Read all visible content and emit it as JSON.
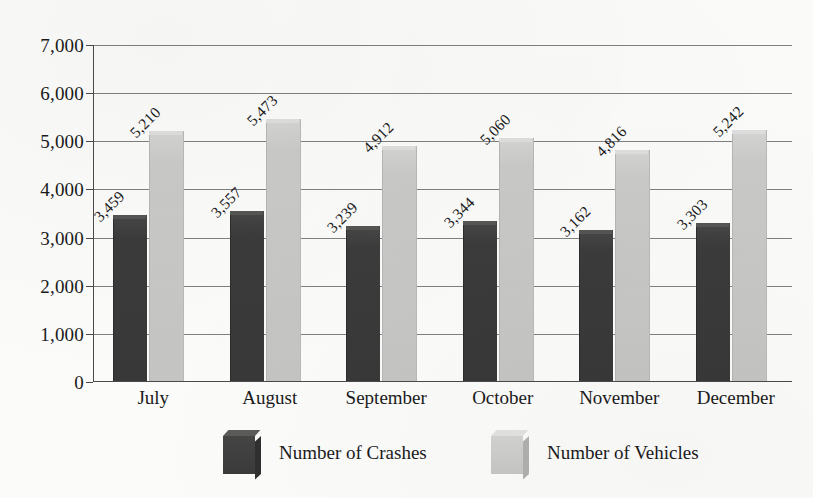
{
  "chart_data": {
    "type": "bar",
    "title": "",
    "subtitle": "",
    "xlabel": "",
    "ylabel": "",
    "ylim": [
      0,
      7000
    ],
    "ytick_labels": [
      "7,000",
      "6,000",
      "5,000",
      "4,000",
      "3,000",
      "2,000",
      "1,000",
      "0"
    ],
    "ytick_values": [
      7000,
      6000,
      5000,
      4000,
      3000,
      2000,
      1000,
      0
    ],
    "grid": true,
    "legend_position": "bottom",
    "categories": [
      "July",
      "August",
      "September",
      "October",
      "November",
      "December"
    ],
    "series": [
      {
        "name": "Number of Crashes",
        "color": "#3b3b3b",
        "values": [
          3459,
          3557,
          3239,
          3344,
          3162,
          3303
        ],
        "labels": [
          "3,459",
          "3,557",
          "3,239",
          "3,344",
          "3,162",
          "3,303"
        ]
      },
      {
        "name": "Number of Vehicles",
        "color": "#c8c8c6",
        "values": [
          5210,
          5473,
          4912,
          5060,
          4816,
          5242
        ],
        "labels": [
          "5,210",
          "5,473",
          "4,912",
          "5,060",
          "4,816",
          "5,242"
        ]
      }
    ]
  },
  "legend": {
    "items": [
      {
        "label": "Number of Crashes",
        "swatch": "dark-cube-swatch"
      },
      {
        "label": "Number of Vehicles",
        "swatch": "light-cube-swatch"
      }
    ]
  }
}
